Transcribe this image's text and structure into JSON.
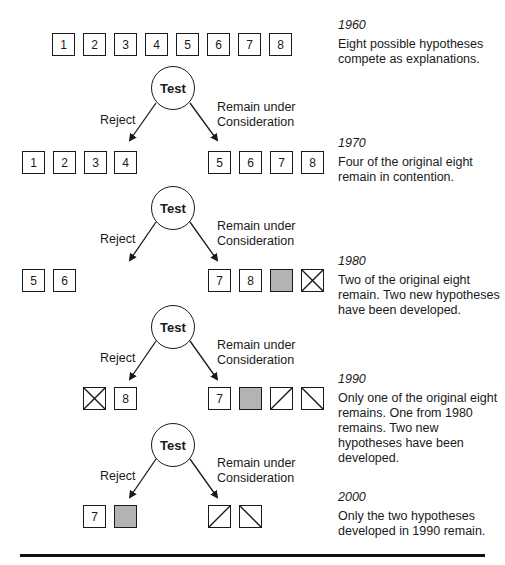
{
  "diagram": {
    "test_label": "Test",
    "reject_label": "Reject",
    "remain_label_line1": "Remain under",
    "remain_label_line2": "Consideration",
    "colors": {
      "line": "#1a1a1a",
      "grey_box": "#b3b3b3",
      "background": "#ffffff"
    },
    "stages": [
      {
        "year": "1960",
        "description": "Eight possible hypotheses compete as explanations.",
        "hypotheses": [
          "1",
          "2",
          "3",
          "4",
          "5",
          "6",
          "7",
          "8"
        ]
      },
      {
        "year": "1970",
        "description": "Four of the original eight remain in contention.",
        "rejected": [
          "1",
          "2",
          "3",
          "4"
        ],
        "remaining": [
          "5",
          "6",
          "7",
          "8"
        ]
      },
      {
        "year": "1980",
        "description": "Two of the original eight remain. Two new hypotheses have been developed.",
        "rejected": [
          "5",
          "6"
        ],
        "remaining": [
          "7",
          "8",
          "grey-filled",
          "crossed-x"
        ]
      },
      {
        "year": "1990",
        "description": "Only one of the original eight remains. One from 1980 remains. Two new hypotheses have been developed.",
        "rejected": [
          "crossed-x",
          "8"
        ],
        "remaining": [
          "7",
          "grey-filled",
          "forward-slash",
          "back-slash"
        ]
      },
      {
        "year": "2000",
        "description": "Only the two hypotheses developed in 1990 remain.",
        "rejected": [
          "7",
          "grey-filled"
        ],
        "remaining": [
          "forward-slash",
          "back-slash"
        ]
      }
    ]
  }
}
